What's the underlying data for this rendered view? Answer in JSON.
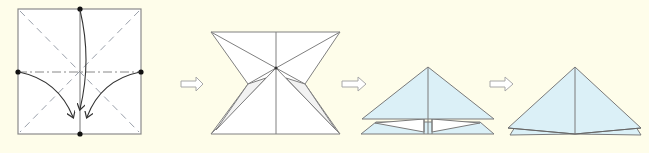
{
  "diagram": {
    "type": "origami-fold-sequence",
    "step_count": 4,
    "colors": {
      "background": "#fefdea",
      "paper_white": "#ffffff",
      "paper_colored": "#dbf0f7",
      "line": "#777777",
      "dot": "#111111",
      "arrow": "#333333",
      "step_arrow_outline": "#a8a8a8"
    },
    "steps": [
      {
        "label": "step-1-square-base-crease",
        "description": "Square with diagonal valley creases, horizontal mountain crease; top, left and right edge points folded down to bottom center",
        "points": [
          "top-center",
          "left-middle",
          "right-middle",
          "bottom-center"
        ],
        "arrows": 3
      },
      {
        "label": "step-2-collapsed-hourglass",
        "description": "Hourglass shape showing collapse with center point"
      },
      {
        "label": "step-3-layered-triangle",
        "description": "Blue triangle over lower layers with white inner flaps"
      },
      {
        "label": "step-4-waterbomb-base",
        "description": "Finished blue triangle (waterbomb base) with two layers"
      }
    ],
    "transitions": [
      {
        "from": 1,
        "to": 2,
        "icon": "hollow-right-arrow"
      },
      {
        "from": 2,
        "to": 3,
        "icon": "hollow-right-arrow"
      },
      {
        "from": 3,
        "to": 4,
        "icon": "hollow-right-arrow"
      }
    ]
  }
}
